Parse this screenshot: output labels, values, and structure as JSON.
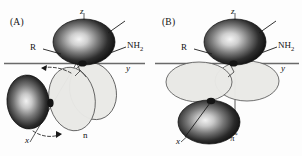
{
  "figure": {
    "background_color": "#fdfdfd",
    "width": 302,
    "height": 156
  },
  "colors": {
    "lobe_dark_edge": "#101010",
    "lobe_dark_mid": "#4a4a4a",
    "lobe_highlight": "#f2f2f2",
    "lobe_light_fill": "#e8e8e6",
    "lobe_light_stroke": "#4a4a4a",
    "axis_line": "#555555",
    "leader_line": "#222222",
    "arrow_dashed": "#2a2a2a",
    "text": "#111111"
  },
  "panels": [
    {
      "id": "A",
      "panel_label": "(A)",
      "orbital_label": "n",
      "axes": {
        "z": "z",
        "y": "y",
        "x": "x"
      },
      "substituents": {
        "left": "R",
        "right_main": "NH",
        "right_sub": "2"
      },
      "lobes": {
        "dark_count": 2,
        "light_count": 2,
        "light_orientation": "tilted",
        "description": "n orbital: two tilted light lobes rotated out of the plane, dark lobes above and lower-left"
      },
      "arrows": {
        "count": 2,
        "style": "dashed-curved",
        "upper_direction": "left",
        "lower_direction": "right"
      }
    },
    {
      "id": "B",
      "panel_label": "(B)",
      "orbital_label_main": "π",
      "orbital_label_sup": "*",
      "axes": {
        "z": "z",
        "y": "y",
        "x": "x"
      },
      "substituents": {
        "left": "R",
        "right_main": "NH",
        "right_sub": "2"
      },
      "lobes": {
        "dark_count": 2,
        "light_count": 2,
        "light_orientation": "horizontal",
        "description": "pi-star orbital: two horizontal light lobes side by side in plane, dark lobes above and below"
      },
      "arrows": {
        "count": 0
      }
    }
  ]
}
